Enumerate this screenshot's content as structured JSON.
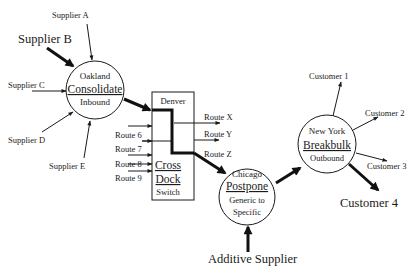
{
  "diagram": {
    "suppliers": [
      {
        "label": "Supplier A",
        "emphasis": false
      },
      {
        "label": "Supplier B",
        "emphasis": true
      },
      {
        "label": "Supplier C",
        "emphasis": false
      },
      {
        "label": "Supplier D",
        "emphasis": false
      },
      {
        "label": "Supplier E",
        "emphasis": false
      }
    ],
    "nodes": {
      "oakland": {
        "city": "Oakland",
        "function": "Consolidate",
        "sub": "Inbound"
      },
      "denver": {
        "city": "Denver",
        "function_line1": "Cross",
        "function_line2": "Dock",
        "sub": "Switch"
      },
      "chicago": {
        "city": "Chicago",
        "function": "Postpone",
        "sub_line1": "Generic to",
        "sub_line2": "Specific"
      },
      "new_york": {
        "city": "New York",
        "function": "Breakbulk",
        "sub": "Outbound"
      }
    },
    "inbound_routes": [
      "Route 6",
      "Route 7",
      "Route 8",
      "Route 9"
    ],
    "outbound_routes": [
      "Route X",
      "Route Y",
      "Route Z"
    ],
    "additive_supplier": "Additive Supplier",
    "customers": [
      {
        "label": "Customer 1",
        "emphasis": false
      },
      {
        "label": "Customer 2",
        "emphasis": false
      },
      {
        "label": "Customer 3",
        "emphasis": false
      },
      {
        "label": "Customer 4",
        "emphasis": true
      }
    ],
    "colors": {
      "line": "#1a1a1a",
      "background": "#ffffff"
    }
  }
}
